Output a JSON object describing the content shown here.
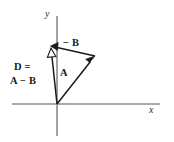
{
  "figure": {
    "type": "vector-diagram",
    "width": 174,
    "height": 142,
    "background_color": "#ffffff"
  },
  "axes": {
    "origin": {
      "x": 57,
      "y": 104
    },
    "x_axis": {
      "label": "x",
      "color": "#8c8c8c",
      "start": {
        "x": 12,
        "y": 104
      },
      "end": {
        "x": 160,
        "y": 104
      }
    },
    "y_axis": {
      "label": "y",
      "color": "#8c8c8c",
      "start": {
        "x": 57,
        "y": 16
      },
      "end": {
        "x": 57,
        "y": 136
      }
    }
  },
  "vectors": [
    {
      "name": "A",
      "label": "A",
      "label_position": {
        "x": 60,
        "y": 68
      },
      "from": {
        "x": 57,
        "y": 104
      },
      "to": {
        "x": 95,
        "y": 56
      },
      "color": "#1a1a1a",
      "arrowhead": "filled",
      "description": "Vector A from origin pointing up and to the right"
    },
    {
      "name": "minus-B",
      "label": "− B",
      "label_position": {
        "x": 63,
        "y": 38
      },
      "from": {
        "x": 95,
        "y": 56
      },
      "to": {
        "x": 51,
        "y": 46
      },
      "color": "#1a1a1a",
      "arrowhead": "filled",
      "description": "Vector negative B from tip of A pointing left and slightly up"
    },
    {
      "name": "D",
      "label_line1": "D =",
      "label_line2": "A − B",
      "label_position": {
        "x": 14,
        "y": 62
      },
      "from": {
        "x": 57,
        "y": 104
      },
      "to": {
        "x": 51,
        "y": 48
      },
      "color": "#1a1a1a",
      "arrowhead": "hollow",
      "description": "Resultant vector D from origin to tip of negative B"
    }
  ],
  "labels": {
    "minus_b": "− B",
    "a": "A",
    "d_equals": "D =",
    "a_minus_b": "A − B",
    "x_axis": "x",
    "y_axis": "y"
  },
  "colors": {
    "vector_stroke": "#1a1a1a",
    "axis_stroke": "#8c8c8c",
    "text": "#1a1a1a",
    "background": "#ffffff"
  }
}
